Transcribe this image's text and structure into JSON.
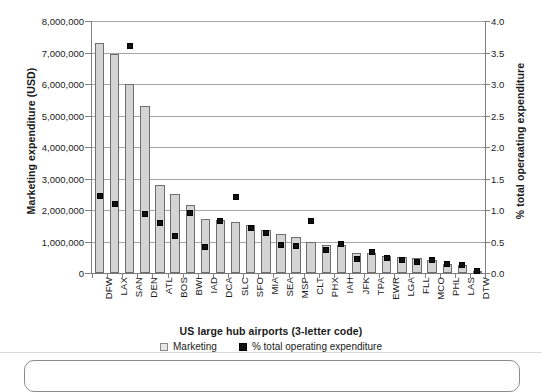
{
  "chart_data": {
    "type": "bar",
    "title": "",
    "xlabel": "US large hub airports (3-letter code)",
    "ylabel": "Marketing expenditure (USD)",
    "y2label": "% total operaating expenditure",
    "categories": [
      "DFW",
      "LAX",
      "SAN",
      "DEN",
      "ATL",
      "BOS",
      "BWI",
      "IAD",
      "DCA",
      "SLC",
      "SFO",
      "MIA",
      "SEA",
      "MSP",
      "CLT",
      "PHX",
      "IAH",
      "JFK",
      "TPA",
      "EWR",
      "LGA",
      "FLL",
      "MCO",
      "PHL",
      "LAS",
      "DTW"
    ],
    "ylim": [
      0,
      8000000
    ],
    "y2lim": [
      0,
      4.0
    ],
    "yticks": [
      "0",
      "1,000,000",
      "2,000,000",
      "3,000,000",
      "4,000,000",
      "5,000,000",
      "6,000,000",
      "7,000,000",
      "8,000,000"
    ],
    "ytick_values": [
      0,
      1000000,
      2000000,
      3000000,
      4000000,
      5000000,
      6000000,
      7000000,
      8000000
    ],
    "y2ticks": [
      "0.0",
      "0.5",
      "1.0",
      "1.5",
      "2.0",
      "2.5",
      "3.0",
      "3.5",
      "4.0"
    ],
    "y2tick_values": [
      0,
      0.5,
      1.0,
      1.5,
      2.0,
      2.5,
      3.0,
      3.5,
      4.0
    ],
    "grid": true,
    "legend_position": "bottom",
    "series": [
      {
        "name": "Marketing",
        "kind": "bar",
        "axis": "left",
        "color": "#d4d4d4",
        "edge_color": "#6e6e6e",
        "values": [
          7300000,
          6950000,
          6000000,
          5300000,
          2800000,
          2500000,
          2150000,
          1700000,
          1680000,
          1620000,
          1520000,
          1380000,
          1230000,
          1150000,
          1000000,
          900000,
          880000,
          620000,
          640000,
          540000,
          500000,
          470000,
          420000,
          300000,
          260000,
          60000
        ]
      },
      {
        "name": "% total operating expenditure",
        "kind": "scatter",
        "axis": "right",
        "color": "#111111",
        "values": [
          1.22,
          1.09,
          3.6,
          0.93,
          0.8,
          0.58,
          0.95,
          0.42,
          0.82,
          1.21,
          0.72,
          0.63,
          0.45,
          0.43,
          0.83,
          0.36,
          0.46,
          0.23,
          0.33,
          0.24,
          0.21,
          0.18,
          0.2,
          0.15,
          0.13,
          0.03
        ]
      }
    ],
    "legend": [
      {
        "label": "Marketing",
        "marker": "hollow-square",
        "color": "#e8e8e8"
      },
      {
        "label": "% total operating expenditure",
        "marker": "filled-square",
        "color": "#111111"
      }
    ]
  }
}
